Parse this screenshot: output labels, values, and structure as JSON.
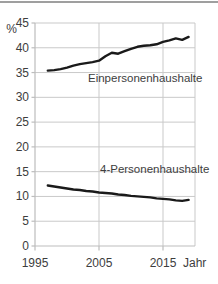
{
  "figure": {
    "top_border_color": "#9f9f9f",
    "background_color": "#ffffff"
  },
  "chart_data": {
    "type": "line",
    "title": "",
    "xlabel": "Jahr",
    "ylabel": "%",
    "x_range": [
      1995,
      2020
    ],
    "y_range": [
      0,
      45
    ],
    "x_ticks": [
      1995,
      2005,
      2015
    ],
    "y_ticks": [
      0,
      5,
      10,
      15,
      20,
      25,
      30,
      35,
      40,
      45
    ],
    "x_gridlines": [
      2005,
      2015
    ],
    "grid": true,
    "legend_position": "inline-labels",
    "line_color": "#1a1a1a",
    "grid_color": "#c9c9c9",
    "axis_color": "#bdbdbd",
    "text_color": "#3d3d3d",
    "series": [
      {
        "name": "Einpersonenhaushalte",
        "x": [
          1997,
          1998,
          1999,
          2000,
          2001,
          2002,
          2003,
          2004,
          2005,
          2006,
          2007,
          2008,
          2009,
          2010,
          2011,
          2012,
          2013,
          2014,
          2015,
          2016,
          2017,
          2018,
          2019
        ],
        "values": [
          35.4,
          35.5,
          35.7,
          36.0,
          36.4,
          36.7,
          36.9,
          37.1,
          37.4,
          38.3,
          39.0,
          38.8,
          39.3,
          39.8,
          40.2,
          40.4,
          40.5,
          40.7,
          41.2,
          41.5,
          41.9,
          41.6,
          42.2
        ]
      },
      {
        "name": "4-Personenhaushalte",
        "x": [
          1997,
          1998,
          1999,
          2000,
          2001,
          2002,
          2003,
          2004,
          2005,
          2006,
          2007,
          2008,
          2009,
          2010,
          2011,
          2012,
          2013,
          2014,
          2015,
          2016,
          2017,
          2018,
          2019
        ],
        "values": [
          12.2,
          12.0,
          11.8,
          11.6,
          11.4,
          11.3,
          11.1,
          11.0,
          10.8,
          10.7,
          10.6,
          10.4,
          10.3,
          10.1,
          10.0,
          9.9,
          9.8,
          9.6,
          9.5,
          9.4,
          9.2,
          9.1,
          9.3
        ]
      }
    ]
  }
}
